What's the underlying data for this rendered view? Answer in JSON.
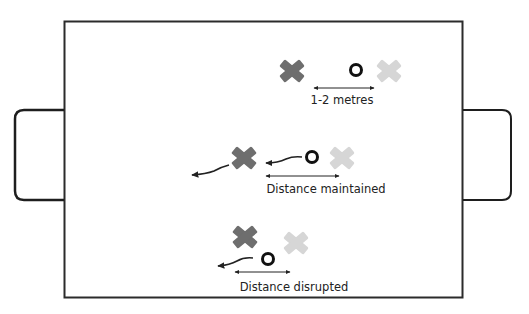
{
  "diagram": {
    "colors": {
      "frame": "#2b2b2b",
      "attacker": "#6e6e6e",
      "defender": "#d6d6d6",
      "ball": "#111111",
      "arrow": "#222222"
    },
    "scenes": [
      {
        "id": "scene-1",
        "label": "1-2 metres"
      },
      {
        "id": "scene-2",
        "label": "Distance maintained"
      },
      {
        "id": "scene-3",
        "label": "Distance disrupted"
      }
    ]
  }
}
